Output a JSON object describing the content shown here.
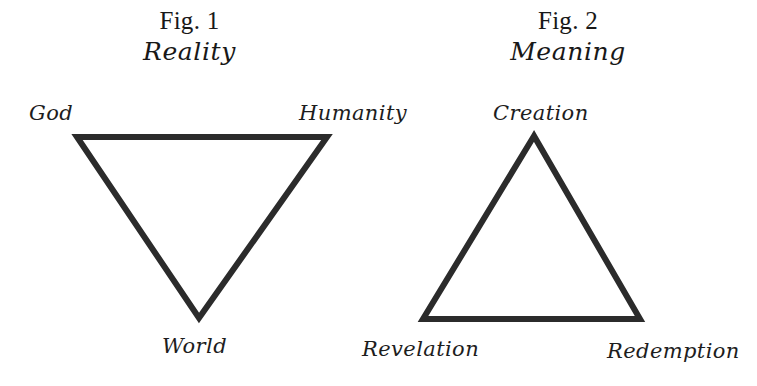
{
  "page": {
    "background_color": "#ffffff",
    "ink_color": "#2b2b2b",
    "width": 757,
    "height": 386
  },
  "figures": [
    {
      "number": "Fig. 1",
      "title": "Reality",
      "shape": "inverted-triangle",
      "vertices": [
        {
          "id": "god",
          "label": "God"
        },
        {
          "id": "humanity",
          "label": "Humanity"
        },
        {
          "id": "world",
          "label": "World"
        }
      ]
    },
    {
      "number": "Fig. 2",
      "title": "Meaning",
      "shape": "upright-triangle",
      "vertices": [
        {
          "id": "creation",
          "label": "Creation"
        },
        {
          "id": "revelation",
          "label": "Revelation"
        },
        {
          "id": "redemption",
          "label": "Redemption"
        }
      ]
    }
  ]
}
